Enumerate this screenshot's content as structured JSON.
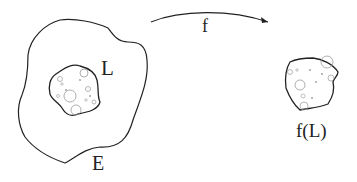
{
  "diagram": {
    "labels": {
      "inner_set": "L",
      "outer_set": "E",
      "map": "f",
      "image_set": "f(L)"
    },
    "colors": {
      "stroke": "#222222",
      "hole_stroke": "#888888",
      "background": "#ffffff"
    },
    "arrow": {
      "from": "E region",
      "to": "f(L)",
      "direction": "left-to-right"
    }
  }
}
